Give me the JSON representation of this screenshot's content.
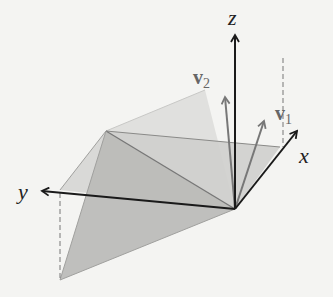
{
  "diagram": {
    "type": "3d-vectors-planes",
    "axes": {
      "x_label": "x",
      "y_label": "y",
      "z_label": "z"
    },
    "vectors": [
      {
        "name": "v1",
        "label_main": "v",
        "label_sub": "1"
      },
      {
        "name": "v2",
        "label_main": "v",
        "label_sub": "2"
      }
    ],
    "colors": {
      "background": "#f4f4f2",
      "axis": "#1a1a1a",
      "vector": "#777777",
      "plane_light": "#dcdcda",
      "plane_dark": "#bdbdbb",
      "dashed": "#777777"
    }
  }
}
